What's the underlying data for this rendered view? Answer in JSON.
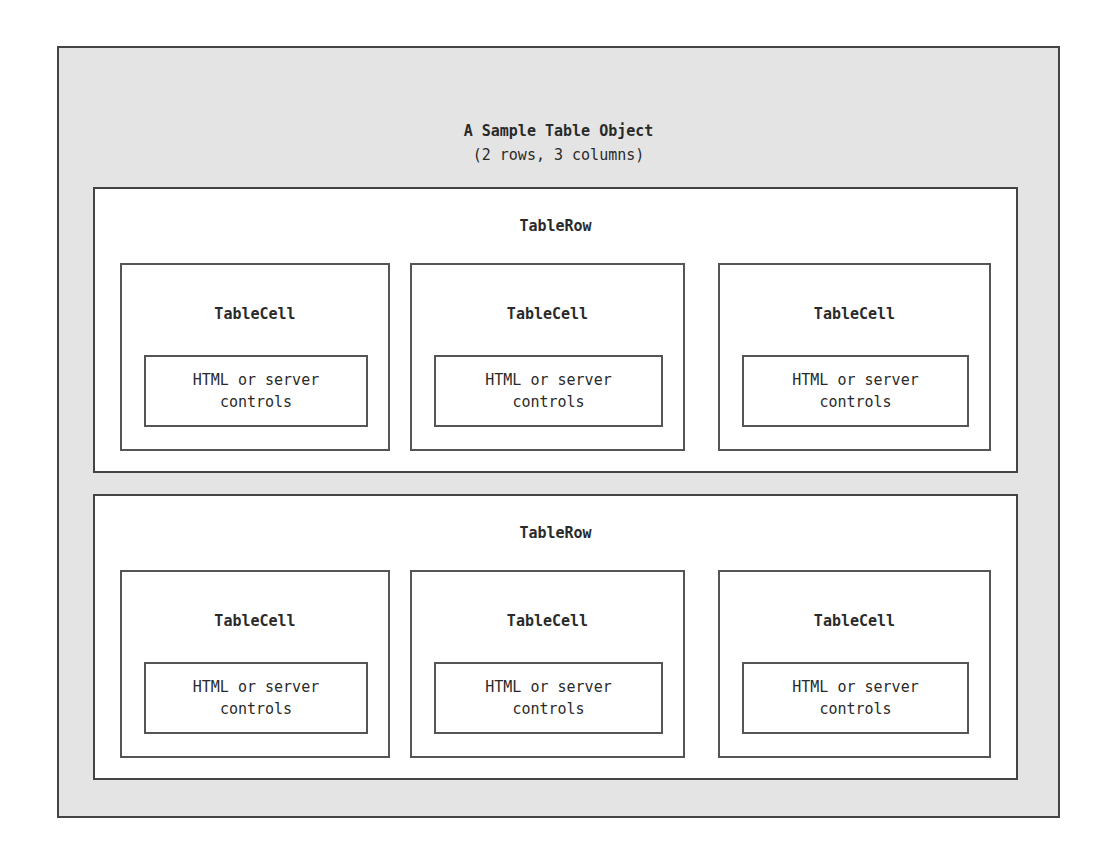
{
  "diagram": {
    "title": "A Sample Table Object",
    "subtitle": "(2 rows, 3 columns)",
    "rows": [
      {
        "label": "TableRow",
        "cells": [
          {
            "label": "TableCell",
            "content": "HTML or server\ncontrols"
          },
          {
            "label": "TableCell",
            "content": "HTML or server\ncontrols"
          },
          {
            "label": "TableCell",
            "content": "HTML or server\ncontrols"
          }
        ]
      },
      {
        "label": "TableRow",
        "cells": [
          {
            "label": "TableCell",
            "content": "HTML or server\ncontrols"
          },
          {
            "label": "TableCell",
            "content": "HTML or server\ncontrols"
          },
          {
            "label": "TableCell",
            "content": "HTML or server\ncontrols"
          }
        ]
      }
    ]
  }
}
